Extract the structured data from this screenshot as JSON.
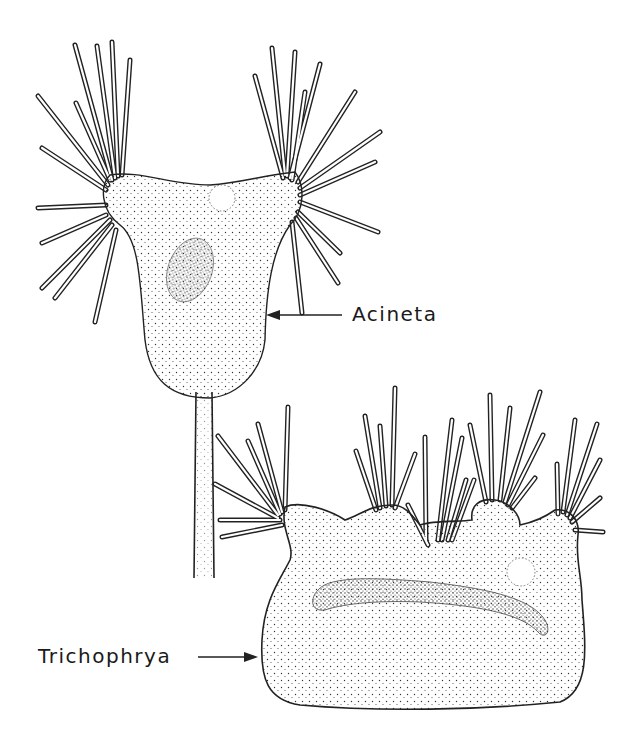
{
  "figure": {
    "organisms": [
      {
        "name": "Acineta",
        "label": "Acineta"
      },
      {
        "name": "Trichophrya",
        "label": "Trichophrya"
      }
    ]
  },
  "colors": {
    "ink": "#1a1a1a",
    "background": "#ffffff"
  }
}
